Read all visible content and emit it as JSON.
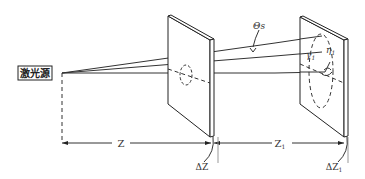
{
  "diagram": {
    "type": "optical-setup",
    "source_label": "激光源",
    "angle_label": "Θs",
    "gamma_label": "γ",
    "gamma_subscript": "1",
    "eta_label": "η",
    "eta_subscript": "1",
    "distance_labels": {
      "z": "Z",
      "z1": "Z",
      "z1_sub": "1",
      "dz": "ΔZ",
      "dz1": "ΔZ",
      "dz1_sub": "1"
    },
    "components": [
      "laser source",
      "first screen (thickness ΔZ)",
      "second screen (thickness ΔZ1)"
    ],
    "colors": {
      "line": "#333333",
      "background": "#ffffff"
    }
  }
}
